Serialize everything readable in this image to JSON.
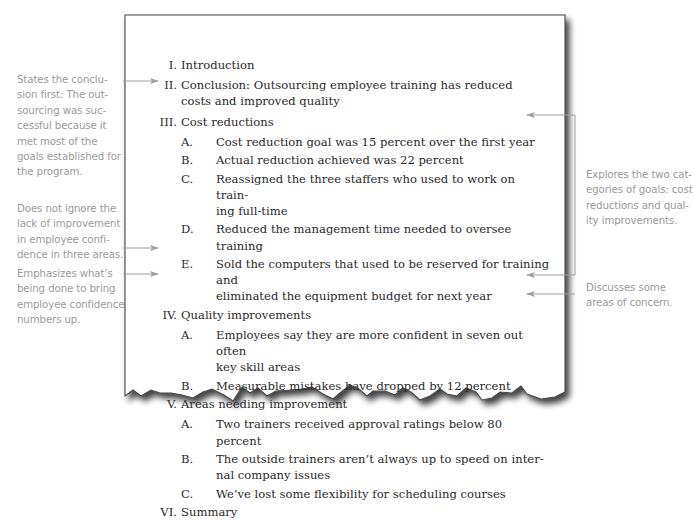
{
  "outline": [
    {
      "num": "I.",
      "text": "Introduction",
      "children": []
    },
    {
      "num": "II.",
      "text": "Conclusion: Outsourcing employee training has reduced costs and improved quality",
      "lines": [
        "Conclusion: Outsourcing employee training has reduced",
        "costs and improved quality"
      ],
      "children": []
    },
    {
      "num": "III.",
      "text": "Cost reductions",
      "children": [
        {
          "num": "A.",
          "lines": [
            "Cost reduction goal was 15 percent over the first year"
          ]
        },
        {
          "num": "B.",
          "lines": [
            "Actual reduction achieved was 22 percent"
          ]
        },
        {
          "num": "C.",
          "lines": [
            "Reassigned the three staffers who used to work on train-",
            "ing full-time"
          ]
        },
        {
          "num": "D.",
          "lines": [
            "Reduced the management time needed to oversee training"
          ]
        },
        {
          "num": "E.",
          "lines": [
            "Sold the computers that used to be reserved for training and",
            "eliminated the equipment budget for next year"
          ]
        }
      ]
    },
    {
      "num": "IV.",
      "text": "Quality improvements",
      "children": [
        {
          "num": "A.",
          "lines": [
            "Employees say they are more confident in seven out often",
            "key skill areas"
          ]
        },
        {
          "num": "B.",
          "lines": [
            "Measurable mistakes have dropped by 12 percent"
          ]
        }
      ]
    },
    {
      "num": "V.",
      "text": "Areas needing improvement",
      "children": [
        {
          "num": "A.",
          "lines": [
            "Two trainers received approval ratings below 80 percent"
          ]
        },
        {
          "num": "B.",
          "lines": [
            "The outside trainers aren’t always up to speed on inter-",
            "nal company issues"
          ]
        },
        {
          "num": "C.",
          "lines": [
            "We’ve lost some flexibility for scheduling courses"
          ]
        }
      ]
    },
    {
      "num": "VI.",
      "text": "Summary",
      "children": []
    }
  ],
  "annotations": {
    "left": [
      {
        "lines": [
          "States the conclu-",
          "sion first: The out-",
          "sourcing was suc-",
          "cessful because it",
          "met most of the",
          "goals established for",
          "the program."
        ],
        "points_to": "II"
      },
      {
        "lines": [
          "Does not ignore the",
          "lack of improvement",
          "in employee confi-",
          "dence in three areas."
        ],
        "points_to": "IV.A"
      },
      {
        "lines": [
          "Emphasizes what’s",
          "being done to bring",
          "employee confidence",
          "numbers up."
        ],
        "points_to": "IV.B"
      }
    ],
    "right": [
      {
        "lines": [
          "Explores the two cat-",
          "egories of goals: cost",
          "reductions and qual-",
          "ity improvements."
        ],
        "points_to": [
          "III",
          "IV.B"
        ]
      },
      {
        "lines": [
          "Discusses some",
          "areas of concern."
        ],
        "points_to": "V"
      }
    ]
  },
  "colors": {
    "paper_border": "#555555",
    "body_text": "#2a2a2a",
    "annotation_text": "#9a9a9a",
    "arrow": "#a0a0a0"
  }
}
